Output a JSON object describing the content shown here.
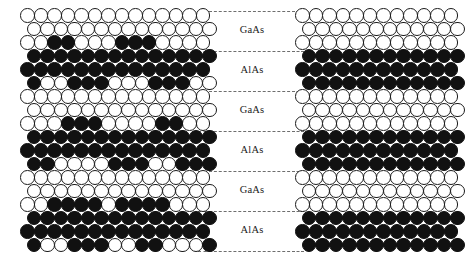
{
  "figure": {
    "panels": [
      {
        "id": "left",
        "name": "rough-interface-lattice",
        "description": "Atomic model with rough, intermixed interfaces",
        "x": 20,
        "y": 8,
        "columns": 14,
        "rows": 18
      },
      {
        "id": "right",
        "name": "abrupt-interface-lattice",
        "description": "Atomic model with perfectly abrupt interfaces",
        "x": 295,
        "y": 8,
        "columns": 12,
        "rows": 18
      }
    ],
    "colors": {
      "ga_atom_fill": "#ffffff",
      "ga_atom_stroke": "#1a1a1a",
      "al_atom_fill": "#111111",
      "divider": "#6e6e6e",
      "label_text": "#1b1b1b",
      "background": "#ffffff"
    },
    "layers": [
      {
        "label": "GaAs",
        "top": 11,
        "bottom": 51
      },
      {
        "label": "AlAs",
        "top": 51,
        "bottom": 91
      },
      {
        "label": "GaAs",
        "top": 91,
        "bottom": 131
      },
      {
        "label": "AlAs",
        "top": 131,
        "bottom": 171
      },
      {
        "label": "GaAs",
        "top": 171,
        "bottom": 211
      },
      {
        "label": "AlAs",
        "top": 211,
        "bottom": 251
      }
    ],
    "divider_y": [
      11,
      51,
      91,
      131,
      171,
      211,
      251
    ],
    "legend": {
      "open_circle_meaning": "Ga (gallium) site",
      "filled_circle_meaning": "Al (aluminium) site"
    }
  },
  "chart_data": {
    "type": "heatmap",
    "xlabel": "",
    "ylabel": "",
    "legend_entries": [
      "Ga site (open circle)",
      "Al site (filled circle)"
    ],
    "annotations": [
      "GaAs",
      "AlAs",
      "GaAs",
      "AlAs",
      "GaAs",
      "AlAs"
    ],
    "grid": false,
    "cell_pitch_px": 13.5,
    "encoding": {
      "0": "open circle (Ga)",
      "1": "filled circle (Al)"
    },
    "series": [
      {
        "name": "rough-interface-lattice",
        "rows": [
          [
            0,
            0,
            0,
            0,
            0,
            0,
            0,
            0,
            0,
            0,
            0,
            0,
            0,
            0
          ],
          [
            0,
            0,
            0,
            0,
            0,
            0,
            0,
            0,
            0,
            0,
            0,
            0,
            0,
            0
          ],
          [
            0,
            0,
            1,
            1,
            0,
            0,
            0,
            1,
            1,
            1,
            0,
            0,
            0,
            0
          ],
          [
            1,
            1,
            1,
            1,
            1,
            1,
            1,
            1,
            1,
            1,
            1,
            1,
            1,
            1
          ],
          [
            1,
            1,
            1,
            1,
            1,
            1,
            1,
            1,
            1,
            1,
            1,
            1,
            1,
            1
          ],
          [
            1,
            0,
            0,
            1,
            1,
            1,
            0,
            0,
            0,
            1,
            1,
            1,
            0,
            0
          ],
          [
            0,
            0,
            0,
            0,
            0,
            0,
            0,
            0,
            0,
            0,
            0,
            0,
            0,
            0
          ],
          [
            0,
            0,
            0,
            0,
            0,
            0,
            0,
            0,
            0,
            0,
            0,
            0,
            0,
            0
          ],
          [
            0,
            0,
            0,
            1,
            1,
            1,
            0,
            0,
            0,
            0,
            1,
            1,
            0,
            0
          ],
          [
            1,
            1,
            1,
            1,
            1,
            1,
            1,
            1,
            1,
            1,
            1,
            1,
            1,
            1
          ],
          [
            1,
            1,
            1,
            1,
            1,
            1,
            1,
            1,
            1,
            1,
            1,
            1,
            1,
            1
          ],
          [
            1,
            1,
            0,
            0,
            0,
            0,
            1,
            1,
            1,
            0,
            0,
            1,
            1,
            1
          ],
          [
            0,
            0,
            0,
            0,
            0,
            0,
            0,
            0,
            0,
            0,
            0,
            0,
            0,
            0
          ],
          [
            0,
            0,
            0,
            0,
            0,
            0,
            0,
            0,
            0,
            0,
            0,
            0,
            0,
            0
          ],
          [
            0,
            0,
            1,
            1,
            1,
            1,
            0,
            1,
            1,
            1,
            1,
            0,
            0,
            0
          ],
          [
            1,
            1,
            1,
            1,
            1,
            1,
            1,
            1,
            1,
            1,
            1,
            1,
            1,
            1
          ],
          [
            1,
            1,
            1,
            1,
            1,
            1,
            1,
            1,
            1,
            1,
            1,
            1,
            1,
            1
          ],
          [
            1,
            0,
            0,
            1,
            1,
            1,
            0,
            0,
            1,
            1,
            0,
            0,
            0,
            1
          ]
        ]
      },
      {
        "name": "abrupt-interface-lattice",
        "rows": [
          [
            0,
            0,
            0,
            0,
            0,
            0,
            0,
            0,
            0,
            0,
            0,
            0
          ],
          [
            0,
            0,
            0,
            0,
            0,
            0,
            0,
            0,
            0,
            0,
            0,
            0
          ],
          [
            0,
            0,
            0,
            0,
            0,
            0,
            0,
            0,
            0,
            0,
            0,
            0
          ],
          [
            1,
            1,
            1,
            1,
            1,
            1,
            1,
            1,
            1,
            1,
            1,
            1
          ],
          [
            1,
            1,
            1,
            1,
            1,
            1,
            1,
            1,
            1,
            1,
            1,
            1
          ],
          [
            1,
            1,
            1,
            1,
            1,
            1,
            1,
            1,
            1,
            1,
            1,
            1
          ],
          [
            0,
            0,
            0,
            0,
            0,
            0,
            0,
            0,
            0,
            0,
            0,
            0
          ],
          [
            0,
            0,
            0,
            0,
            0,
            0,
            0,
            0,
            0,
            0,
            0,
            0
          ],
          [
            0,
            0,
            0,
            0,
            0,
            0,
            0,
            0,
            0,
            0,
            0,
            0
          ],
          [
            1,
            1,
            1,
            1,
            1,
            1,
            1,
            1,
            1,
            1,
            1,
            1
          ],
          [
            1,
            1,
            1,
            1,
            1,
            1,
            1,
            1,
            1,
            1,
            1,
            1
          ],
          [
            1,
            1,
            1,
            1,
            1,
            1,
            1,
            1,
            1,
            1,
            1,
            1
          ],
          [
            0,
            0,
            0,
            0,
            0,
            0,
            0,
            0,
            0,
            0,
            0,
            0
          ],
          [
            0,
            0,
            0,
            0,
            0,
            0,
            0,
            0,
            0,
            0,
            0,
            0
          ],
          [
            0,
            0,
            0,
            0,
            0,
            0,
            0,
            0,
            0,
            0,
            0,
            0
          ],
          [
            1,
            1,
            1,
            1,
            1,
            1,
            1,
            1,
            1,
            1,
            1,
            1
          ],
          [
            1,
            1,
            1,
            1,
            1,
            1,
            1,
            1,
            1,
            1,
            1,
            1
          ],
          [
            1,
            1,
            1,
            1,
            1,
            1,
            1,
            1,
            1,
            1,
            1,
            1
          ]
        ]
      }
    ]
  }
}
